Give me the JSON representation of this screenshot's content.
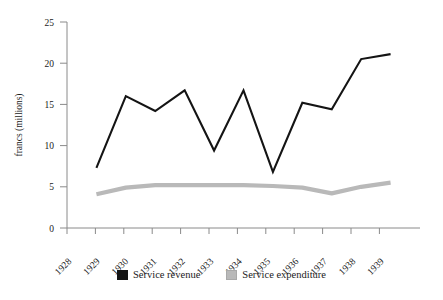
{
  "chart_data": {
    "type": "line",
    "title": "",
    "xlabel": "",
    "ylabel": "francs  (millions)",
    "x": [
      1928,
      1929,
      1930,
      1931,
      1932,
      1933,
      1934,
      1935,
      1936,
      1937,
      1938,
      1939
    ],
    "categories": [
      "1928",
      "1929",
      "1930",
      "1931",
      "1932",
      "1933",
      "1934",
      "1935",
      "1936",
      "1937",
      "1938",
      "1939"
    ],
    "xlim": [
      1928,
      1940
    ],
    "ylim": [
      0,
      25
    ],
    "yticks": [
      0,
      5,
      10,
      15,
      20,
      25
    ],
    "ytick_labels": [
      "0",
      "5",
      "10",
      "15",
      "20",
      "25"
    ],
    "grid": false,
    "legend_position": "bottom-center",
    "series": [
      {
        "name": "Service revenue",
        "color": "#141414",
        "x": [
          1929,
          1930,
          1931,
          1932,
          1933,
          1934,
          1935,
          1936,
          1937,
          1938,
          1939
        ],
        "values": [
          7.3,
          16.0,
          14.2,
          16.7,
          9.4,
          16.7,
          6.8,
          15.2,
          14.4,
          20.5,
          21.1
        ]
      },
      {
        "name": "Service expenditure",
        "color": "#b9b9b9",
        "x": [
          1929,
          1930,
          1931,
          1932,
          1933,
          1934,
          1935,
          1936,
          1937,
          1938,
          1939
        ],
        "values": [
          4.1,
          4.9,
          5.2,
          5.2,
          5.2,
          5.2,
          5.1,
          4.9,
          4.2,
          5.0,
          5.5
        ]
      }
    ]
  },
  "legend": {
    "entries": [
      {
        "label": "Service revenue",
        "color": "#141414"
      },
      {
        "label": "Service expenditure",
        "color": "#b9b9b9"
      }
    ]
  },
  "axes": {
    "y_title": "francs  (millions)"
  }
}
